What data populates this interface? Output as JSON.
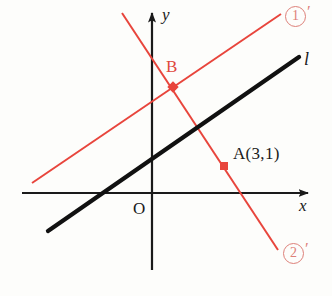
{
  "figure": {
    "kind": "coordinate-geometry-diagram",
    "width": 332,
    "height": 296,
    "background_color": "#fdfdfb"
  },
  "colors": {
    "axis": "#1a1a1a",
    "line_l": "#111111",
    "red_line": "#e8453c",
    "red_point": "#e8453c",
    "red_label": "#e0483d",
    "tag_red": "#dd8079",
    "text": "#1a1a1a"
  },
  "axes": {
    "x_axis_label": "x",
    "y_axis_label": "y",
    "origin_label": "O",
    "x_axis": {
      "y": 193,
      "x_start": 22,
      "x_end": 313,
      "arrow": "right"
    },
    "y_axis": {
      "x": 152,
      "y_start": 8,
      "y_end": 270,
      "arrow": "up"
    }
  },
  "lines": [
    {
      "id": "line-l",
      "label": "l",
      "color": "#111111",
      "width": 4,
      "x1": 48,
      "y1": 231,
      "x2": 299,
      "y2": 57,
      "label_x": 303,
      "label_y": 50
    },
    {
      "id": "line-1prime",
      "label": "①′",
      "tag_number": "1",
      "tag_prime": "′",
      "color": "#e8453c",
      "width": 2,
      "x1": 32,
      "y1": 183,
      "x2": 281,
      "y2": 14,
      "label_x": 285,
      "label_y": 6
    },
    {
      "id": "line-2prime",
      "label": "②′",
      "tag_number": "2",
      "tag_prime": "′",
      "color": "#e8453c",
      "width": 2,
      "x1": 122,
      "y1": 13,
      "x2": 278,
      "y2": 250,
      "label_x": 283,
      "label_y": 243
    }
  ],
  "points": [
    {
      "id": "point-B",
      "label": "B",
      "color": "#e8453c",
      "x": 173,
      "y": 87,
      "radius": 4,
      "label_x": 167,
      "label_y": 60,
      "label_color": "#e0483d"
    },
    {
      "id": "point-A",
      "label": "A(3,1)",
      "color": "#e8453c",
      "x": 224,
      "y": 166,
      "radius": 4,
      "label_x": 233,
      "label_y": 145,
      "label_color": "#1a1a1a"
    }
  ]
}
